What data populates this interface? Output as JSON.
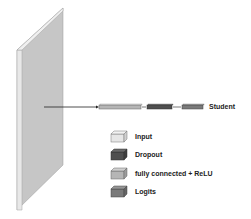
{
  "diagram": {
    "network_label": "Student",
    "colors": {
      "input_face": "#c8c8c8",
      "input_edge": "#e4e4e4",
      "input_top": "#eeeeee",
      "dropout": "#555555",
      "fc_relu": "#a9a9a9",
      "logits": "#7d7d7d",
      "input_legend": "#e6e6e6"
    },
    "layers": [
      {
        "type": "input",
        "shape": "slab"
      },
      {
        "type": "fully connected + ReLU"
      },
      {
        "type": "Dropout"
      },
      {
        "type": "Logits"
      }
    ]
  },
  "legend": {
    "items": [
      {
        "label": "Input",
        "color": "#e6e6e6"
      },
      {
        "label": "Dropout",
        "color": "#4f4f4f"
      },
      {
        "label": "fully connected + ReLU",
        "color": "#b5b5b5"
      },
      {
        "label": "Logits",
        "color": "#7a7a7a"
      }
    ]
  }
}
